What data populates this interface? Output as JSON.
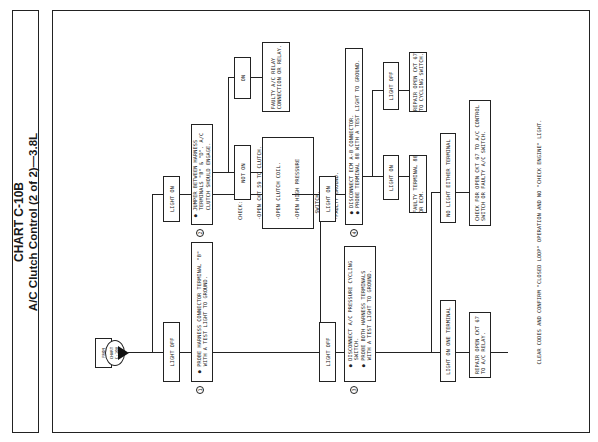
{
  "title": {
    "line1": "CHART C-10B",
    "line2": "A/C Clutch Control (2 of 2)—3.8L"
  },
  "start": {
    "label_line1": "FROM",
    "label_line2": "CHART",
    "label_line3": "C-10A"
  },
  "steps": {
    "step1": {
      "number": "1",
      "lines": [
        "PROBE HARNESS CONNECTOR TERMINAL \"B\"",
        "WITH A TEST LIGHT TO GROUND."
      ]
    },
    "step2": {
      "number": "2",
      "lines": [
        "JUMPER BETWEEN HARNESS",
        "TERMINALS \"B\" & \"D\". A/C",
        "CLUTCH SHOULD ENGAGE."
      ]
    },
    "step3": {
      "number": "3",
      "lines": [
        "DISCONNECT A/C PRESSURE CYCLING",
        "SWITCH.",
        "PROBE BOTH HARNESS TERMINALS",
        "WITH A TEST LIGHT TO GROUND."
      ]
    },
    "step4": {
      "number": "4",
      "lines": [
        "DISCONNECT ECM A-B CONNECTOR.",
        "PROBE TERMINAL 88 WITH A TEST LIGHT TO GROUND."
      ]
    }
  },
  "branches": {
    "s1_off": "LIGHT OFF",
    "s1_on": "LIGHT ON",
    "s2_not_on": "NOT ON",
    "s2_on": "ON",
    "s3_off": "LIGHT OFF",
    "s3_on": "LIGHT ON",
    "s4_on": "LIGHT ON",
    "s4_off": "LIGHT OFF",
    "s3_one": "LIGHT ON ONE TERMINAL",
    "s3_none": "NO LIGHT EITHER TERMINAL"
  },
  "results": {
    "check": [
      "CHECK:",
      "-OPEN CKT 59 TO CLUTCH.",
      "-OPEN CLUTCH COIL.",
      "-OPEN HIGH PRESSURE",
      "  SWITCH.",
      "-FAULTY GROUND."
    ],
    "faulty_relay": [
      "FAULTY A/C RELAY",
      "CONNECTION OR RELAY."
    ],
    "faulty_88": [
      "FAULTY TERMINAL 88",
      "OR ECM."
    ],
    "repair_cycling": [
      "REPAIR OPEN CKT 67",
      "TO CYCLING SWITCH."
    ],
    "repair_relay": [
      "REPAIR OPEN CKT 67",
      "TO A/C RELAY."
    ],
    "check_control": [
      "CHECK FOR OPEN CKT 67 TO A/C CONTROL",
      "SWITCH OR FAULTY A/C SWITCH."
    ]
  },
  "footer": "CLEAR CODES AND CONFIRM \"CLOSED LOOP\" OPERATION AND NO \"CHECK ENGINE\" LIGHT."
}
